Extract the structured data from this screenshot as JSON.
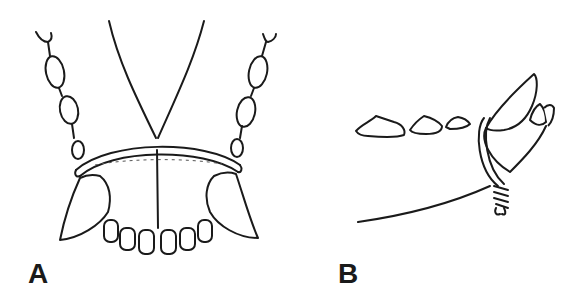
{
  "figure": {
    "panels": [
      {
        "id": "A",
        "label": "A",
        "view": "frontal view of lower jaw with wire loop around canines"
      },
      {
        "id": "B",
        "label": "B",
        "view": "lateral view of jaw with wire loop twisted around canine"
      }
    ],
    "colors": {
      "ink": "#1a1a1a",
      "background": "#ffffff"
    }
  }
}
